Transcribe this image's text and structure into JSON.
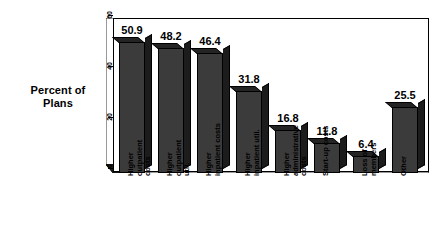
{
  "chart_data": {
    "type": "bar",
    "title": "",
    "subtitle": "",
    "xlabel": "",
    "ylabel": "Percent of Plans",
    "ylim": [
      0,
      60
    ],
    "yticks": [
      0,
      20,
      40,
      60
    ],
    "ytick_labels": [
      "0",
      "20",
      "40",
      "60"
    ],
    "grid": false,
    "legend": null,
    "style": "3d-bar",
    "bar_color": "#3b3b3b",
    "bar_side_color": "#1c1c1c",
    "frame_color": "#000000",
    "background_color": "#ffffff",
    "categories": [
      "Higher outpatient costs",
      "Higher outpatient util.",
      "Higher inpatient costs",
      "Higher inpatient util.",
      "Higher administrative costs",
      "Start-up costs",
      "Loss of members",
      "Other"
    ],
    "category_lines": [
      "Higher\noutpatient\ncosts",
      "Higher\noutpatient\nutil.",
      "Higher\ninpatient costs",
      "Higher\ninpatient util.",
      "Higher\nadministrative\ncosts",
      "Start-up costs",
      "Loss of\nmembers",
      "Other"
    ],
    "values": [
      50.9,
      48.2,
      46.4,
      31.8,
      16.8,
      11.8,
      6.4,
      25.5
    ],
    "value_labels": [
      "50.9",
      "48.2",
      "46.4",
      "31.8",
      "16.8",
      "11.8",
      "6.4",
      "25.5"
    ]
  },
  "axis_title": {
    "line1": "Percent of",
    "line2": "Plans"
  }
}
